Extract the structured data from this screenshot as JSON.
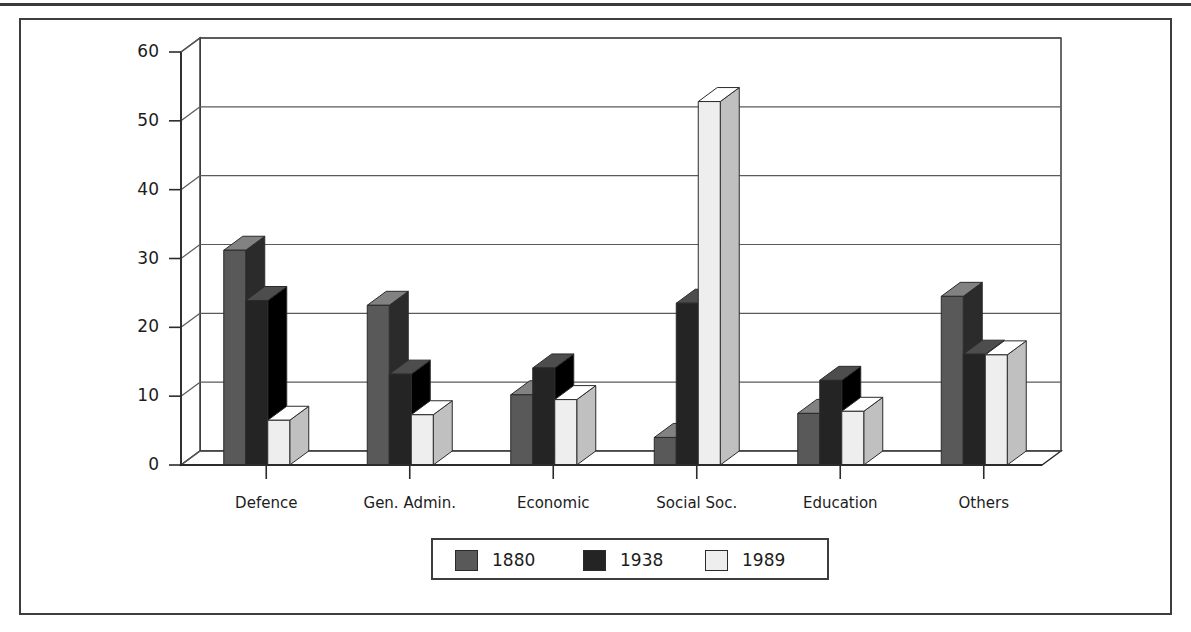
{
  "chart_data": {
    "type": "bar",
    "title": "",
    "subtitle": "",
    "xlabel": "",
    "ylabel": "",
    "categories": [
      "Defence",
      "Gen. Admin.",
      "Economic",
      "Social Soc.",
      "Education",
      "Others"
    ],
    "series": [
      {
        "name": "1880",
        "color": "#595959",
        "values": [
          31.2,
          23.2,
          10.2,
          4.0,
          7.5,
          24.5
        ]
      },
      {
        "name": "1938",
        "color": "#242424",
        "values": [
          23.9,
          13.2,
          14.1,
          23.5,
          12.3,
          16.1
        ]
      },
      {
        "name": "1989",
        "color": "#eeeeee",
        "values": [
          6.5,
          7.3,
          9.5,
          52.8,
          7.8,
          16.0
        ]
      }
    ],
    "ylim": [
      0,
      60
    ],
    "yticks": [
      0,
      10,
      20,
      30,
      40,
      50,
      60
    ],
    "ytick_labels": [
      "0",
      "10",
      "20",
      "30",
      "40",
      "50",
      "60"
    ],
    "grid": true,
    "legend_position": "bottom",
    "style": "3d-bar"
  },
  "legend": {
    "entries": [
      {
        "label": "1880",
        "color": "#595959"
      },
      {
        "label": "1938",
        "color": "#242424"
      },
      {
        "label": "1989",
        "color": "#eeeeee"
      }
    ]
  },
  "colors": {
    "frame": "#3d3d3d",
    "axis": "#2b2b2b",
    "grid": "#5a5a5a",
    "text": "#1c1c1c",
    "background": "#ffffff"
  }
}
